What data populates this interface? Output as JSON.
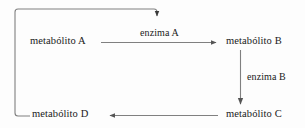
{
  "diagram": {
    "type": "metabolic-pathway-feedback-inhibition",
    "background_color": "#fdfdfd",
    "line_color": "#808080",
    "text_color": "#1a1a1a",
    "nodes": [
      {
        "id": "metabolito-a",
        "label": "metabólito A"
      },
      {
        "id": "metabolito-b",
        "label": "metabólito B"
      },
      {
        "id": "metabolito-c",
        "label": "metabólito C"
      },
      {
        "id": "metabolito-d",
        "label": "metabólito D"
      }
    ],
    "edges": [
      {
        "id": "edge-a-to-b",
        "from": "metabolito-a",
        "to": "metabolito-b",
        "label": "enzima A",
        "direction": "right"
      },
      {
        "id": "edge-b-to-c",
        "from": "metabolito-b",
        "to": "metabolito-c",
        "label": "enzima B",
        "direction": "down"
      },
      {
        "id": "edge-c-to-d",
        "from": "metabolito-c",
        "to": "metabolito-d",
        "label": "",
        "direction": "left"
      },
      {
        "id": "edge-d-feedback",
        "from": "metabolito-d",
        "to": "enzima-a",
        "label": "",
        "direction": "feedback-up-right-down"
      }
    ]
  }
}
